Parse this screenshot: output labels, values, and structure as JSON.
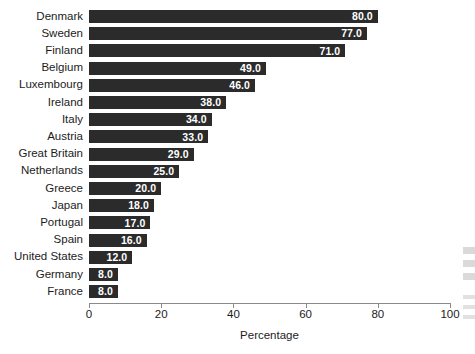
{
  "chart_data": {
    "type": "bar",
    "orientation": "horizontal",
    "title": "",
    "xlabel": "Percentage",
    "ylabel": "",
    "xlim": [
      0,
      100
    ],
    "xticks": [
      0,
      20,
      40,
      60,
      80,
      100
    ],
    "xtick_labels": [
      "0",
      "20",
      "40",
      "60",
      "80",
      "100"
    ],
    "grid": false,
    "legend": false,
    "bar_color": "#2b2b2b",
    "value_label_color": "#ffffff",
    "value_label_format": "one-decimal",
    "categories": [
      "Denmark",
      "Sweden",
      "Finland",
      "Belgium",
      "Luxembourg",
      "Ireland",
      "Italy",
      "Austria",
      "Great Britain",
      "Netherlands",
      "Greece",
      "Japan",
      "Portugal",
      "Spain",
      "United States",
      "Germany",
      "France"
    ],
    "values": [
      80.0,
      77.0,
      71.0,
      49.0,
      46.0,
      38.0,
      34.0,
      33.0,
      29.0,
      25.0,
      20.0,
      18.0,
      17.0,
      16.0,
      12.0,
      8.0,
      8.0
    ],
    "value_labels": [
      "80.0",
      "77.0",
      "71.0",
      "49.0",
      "46.0",
      "38.0",
      "34.0",
      "33.0",
      "29.0",
      "25.0",
      "20.0",
      "18.0",
      "17.0",
      "16.0",
      "12.0",
      "8.0",
      "8.0"
    ]
  }
}
